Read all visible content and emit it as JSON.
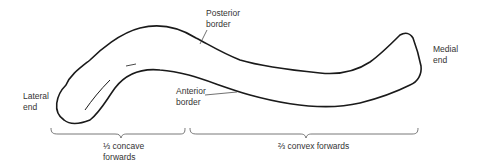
{
  "figure": {
    "labels": {
      "posterior_border": "Posterior\nborder",
      "anterior_border": "Anterior\nborder",
      "lateral_end": "Lateral\nend",
      "medial_end": "Medial\nend",
      "concave_third": "⅓ concave\nforwards",
      "convex_two_thirds": "⅔ convex forwards"
    },
    "colors": {
      "outline": "#1a1a1a",
      "text": "#333333",
      "background": "#ffffff"
    }
  }
}
